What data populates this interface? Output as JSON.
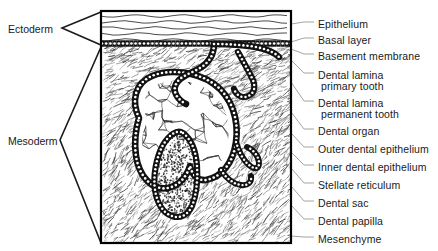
{
  "figure": {
    "frame": {
      "x": 101,
      "y": 11,
      "width": 190,
      "height": 232
    },
    "colors": {
      "ink": "#111111",
      "frame": "#000000",
      "leader": "#9a9a9a",
      "bracket": "#1a1a1a",
      "paper": "#ffffff"
    }
  },
  "left_labels": [
    {
      "text": "Ectoderm",
      "x": 8,
      "y": 23,
      "bracket_top": 12,
      "bracket_bottom": 45,
      "apex_x": 62,
      "apex_y": 28
    },
    {
      "text": "Mesoderm",
      "x": 8,
      "y": 135,
      "bracket_top": 47,
      "bracket_bottom": 243,
      "apex_x": 60,
      "apex_y": 140
    }
  ],
  "right_labels": [
    {
      "text": "Epithelium",
      "line2": "",
      "x": 318,
      "y": 19,
      "anchor_x": 291,
      "anchor_y": 24,
      "target_x": 295,
      "target_y": 24
    },
    {
      "text": "Basal layer",
      "line2": "",
      "x": 318,
      "y": 35,
      "anchor_x": 291,
      "anchor_y": 42,
      "target_x": 295,
      "target_y": 40
    },
    {
      "text": "Basement membrane",
      "line2": "",
      "x": 318,
      "y": 51,
      "anchor_x": 291,
      "anchor_y": 49,
      "target_x": 295,
      "target_y": 56
    },
    {
      "text": "Dental lamina",
      "line2": "primary tooth",
      "x": 318,
      "y": 70,
      "anchor_x": 291,
      "anchor_y": 60,
      "target_x": 295,
      "target_y": 75
    },
    {
      "text": "Dental lamina",
      "line2": "permanent tooth",
      "x": 318,
      "y": 98,
      "anchor_x": 291,
      "anchor_y": 82,
      "target_x": 295,
      "target_y": 103
    },
    {
      "text": "Dental organ",
      "line2": "",
      "x": 318,
      "y": 126,
      "anchor_x": 291,
      "anchor_y": 112,
      "target_x": 295,
      "target_y": 131
    },
    {
      "text": "Outer dental epithelium",
      "line2": "",
      "x": 318,
      "y": 144,
      "anchor_x": 291,
      "anchor_y": 133,
      "target_x": 295,
      "target_y": 149
    },
    {
      "text": "Inner dental epithelium",
      "line2": "",
      "x": 318,
      "y": 162,
      "anchor_x": 291,
      "anchor_y": 152,
      "target_x": 295,
      "target_y": 167
    },
    {
      "text": "Stellate reticulum",
      "line2": "",
      "x": 318,
      "y": 180,
      "anchor_x": 291,
      "anchor_y": 168,
      "target_x": 295,
      "target_y": 185
    },
    {
      "text": "Dental sac",
      "line2": "",
      "x": 318,
      "y": 198,
      "anchor_x": 291,
      "anchor_y": 186,
      "target_x": 295,
      "target_y": 203
    },
    {
      "text": "Dental papilla",
      "line2": "",
      "x": 318,
      "y": 216,
      "anchor_x": 291,
      "anchor_y": 205,
      "target_x": 295,
      "target_y": 221
    },
    {
      "text": "Mesenchyme",
      "line2": "",
      "x": 318,
      "y": 234,
      "anchor_x": 291,
      "anchor_y": 236,
      "target_x": 295,
      "target_y": 239
    }
  ],
  "layers": {
    "epithelium": {
      "top": 12,
      "bottom": 40,
      "wavy_line_count": 5
    },
    "basal_layer": {
      "top": 40,
      "bottom": 46
    },
    "mesenchyme": {
      "top": 46,
      "bottom": 242
    }
  },
  "structures": {
    "dental_organ_label": "Dental organ",
    "stellate_reticulum_label": "Stellate reticulum",
    "dental_papilla_label": "Dental papilla",
    "permanent_bud_label": "Dental lamina permanent tooth"
  }
}
